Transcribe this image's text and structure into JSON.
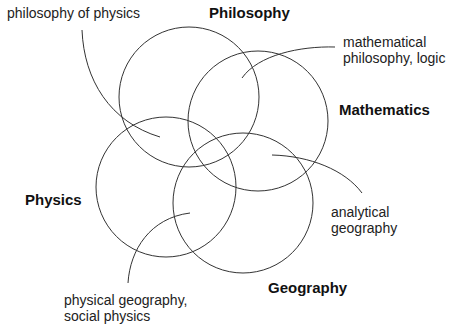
{
  "diagram": {
    "type": "venn",
    "sets": [
      {
        "id": "philosophy",
        "label": "Philosophy",
        "cx": 189,
        "cy": 97,
        "r": 70
      },
      {
        "id": "mathematics",
        "label": "Mathematics",
        "cx": 258,
        "cy": 121,
        "r": 70
      },
      {
        "id": "physics",
        "label": "Physics",
        "cx": 166,
        "cy": 187,
        "r": 70
      },
      {
        "id": "geography",
        "label": "Geography",
        "cx": 243,
        "cy": 203,
        "r": 70
      }
    ],
    "annotations": [
      {
        "id": "philosophy-of-physics",
        "line1": "philosophy of physics",
        "line2": ""
      },
      {
        "id": "mathematical-philosophy",
        "line1": "mathematical",
        "line2": "philosophy, logic"
      },
      {
        "id": "analytical-geography",
        "line1": "analytical",
        "line2": "geography"
      },
      {
        "id": "physical-geography",
        "line1": "physical geography,",
        "line2": "social physics"
      }
    ],
    "stroke_color": "#333333"
  }
}
